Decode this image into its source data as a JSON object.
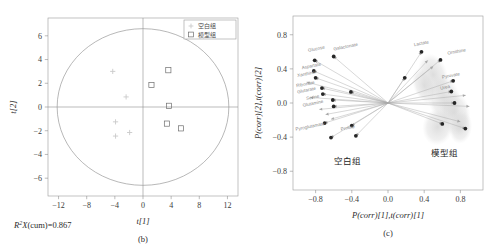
{
  "figure": {
    "panels": [
      "b",
      "c"
    ]
  },
  "chart_data": [
    {
      "type": "scatter",
      "panel_id": "(b)",
      "title": "",
      "xlabel": "t[1]",
      "ylabel": "t[2]",
      "xlim": [
        -13.5,
        13.5
      ],
      "ylim": [
        -7.5,
        7.5
      ],
      "xticks": [
        -12,
        -8,
        -4,
        0,
        4,
        8,
        12
      ],
      "xticklabels": [
        "−12",
        "−8",
        "−4",
        "0",
        "4",
        "8",
        "12"
      ],
      "yticks": [
        -6,
        -4,
        -2,
        0,
        2,
        4,
        6
      ],
      "yticklabels": [
        "−6",
        "−4",
        "−2",
        "0",
        "2",
        "4",
        "6"
      ],
      "grid": false,
      "annotation": "R²X(cum)=0.867",
      "hotelling_ellipse": {
        "rx": 12.2,
        "ry": 6.6
      },
      "legend": {
        "position": "top-right",
        "entries": [
          {
            "label": "空白组",
            "marker": "plus",
            "color": "#c9c9c9"
          },
          {
            "label": "模型组",
            "marker": "square",
            "color": "#6e6e6e"
          }
        ]
      },
      "series": [
        {
          "name": "空白组",
          "marker": "plus",
          "points": [
            {
              "x": -4.3,
              "y": 3.0
            },
            {
              "x": -2.4,
              "y": 0.85
            },
            {
              "x": -3.9,
              "y": -1.25
            },
            {
              "x": -3.9,
              "y": -2.45
            },
            {
              "x": -1.9,
              "y": -2.15
            }
          ]
        },
        {
          "name": "模型组",
          "marker": "square",
          "points": [
            {
              "x": 3.6,
              "y": 3.1
            },
            {
              "x": 1.2,
              "y": 1.85
            },
            {
              "x": 3.7,
              "y": 0.1
            },
            {
              "x": 3.4,
              "y": -1.4
            },
            {
              "x": 5.4,
              "y": -1.8
            }
          ]
        }
      ]
    },
    {
      "type": "scatter",
      "panel_id": "(c)",
      "title": "",
      "xlabel": "P(corr)[1],t(corr)[1]",
      "ylabel": "P(corr)[2],t(corr)[2]",
      "xlim": [
        -1.05,
        1.05
      ],
      "ylim": [
        -1.02,
        1.02
      ],
      "xticks": [
        -0.8,
        -0.4,
        0.0,
        0.4,
        0.8
      ],
      "xticklabels": [
        "−0.8",
        "−0.4",
        "0.0",
        "0.4",
        "0.8"
      ],
      "yticks": [
        -0.8,
        -0.4,
        0.0,
        0.4,
        0.8
      ],
      "yticklabels": [
        "−0.8",
        "−0.4",
        "0.0",
        "0.4",
        "0.8"
      ],
      "grid": false,
      "group_annotations": [
        {
          "text": "空白组",
          "x": -0.45,
          "y": -0.72
        },
        {
          "text": "模型组",
          "x": 0.62,
          "y": -0.62
        }
      ],
      "loadings": [
        {
          "label": "Glucose",
          "x": -0.81,
          "y": 0.5,
          "lx": -0.88,
          "ly": 0.6,
          "anchor": "start"
        },
        {
          "label": "Galactonate",
          "x": -0.6,
          "y": 0.545,
          "lx": -0.6,
          "ly": 0.615,
          "anchor": "start"
        },
        {
          "label": "Aspartate",
          "x": -0.82,
          "y": 0.375,
          "lx": -0.95,
          "ly": 0.395,
          "anchor": "start"
        },
        {
          "label": "Xanthine",
          "x": -0.8,
          "y": 0.295,
          "lx": -1.0,
          "ly": 0.305,
          "anchor": "start"
        },
        {
          "label": "Ribonate",
          "x": -0.73,
          "y": 0.175,
          "lx": -1.01,
          "ly": 0.185,
          "anchor": "start"
        },
        {
          "label": "Glutarate",
          "x": -0.72,
          "y": 0.105,
          "lx": -1.0,
          "ly": 0.112,
          "anchor": "start"
        },
        {
          "label": "Serine",
          "x": -0.61,
          "y": 0.035,
          "lx": -0.9,
          "ly": 0.035,
          "anchor": "start"
        },
        {
          "label": "Glutamine",
          "x": -0.6,
          "y": -0.04,
          "lx": -0.94,
          "ly": -0.045,
          "anchor": "start"
        },
        {
          "label": "Pyroglutamate",
          "x": -0.7,
          "y": -0.235,
          "lx": -1.02,
          "ly": -0.325,
          "anchor": "start"
        },
        {
          "label": "Proline",
          "x": -0.4,
          "y": -0.265,
          "lx": -0.52,
          "ly": -0.325,
          "anchor": "start"
        },
        {
          "label": "Lactate",
          "x": 0.37,
          "y": 0.6,
          "lx": 0.29,
          "ly": 0.665,
          "anchor": "start"
        },
        {
          "label": "Ornithine",
          "x": 0.58,
          "y": 0.505,
          "lx": 0.66,
          "ly": 0.565,
          "anchor": "start"
        },
        {
          "label": "Pyruvate",
          "x": 0.72,
          "y": 0.26,
          "lx": 0.6,
          "ly": 0.285,
          "anchor": "start"
        },
        {
          "label": "Urea",
          "x": 0.7,
          "y": 0.135,
          "lx": 0.58,
          "ly": 0.155,
          "anchor": "start"
        }
      ],
      "extra_points": [
        {
          "x": -0.41,
          "y": 0.13
        },
        {
          "x": -0.63,
          "y": -0.405
        },
        {
          "x": -0.355,
          "y": -0.385
        },
        {
          "x": 0.185,
          "y": 0.295
        },
        {
          "x": 0.735,
          "y": 0.0
        },
        {
          "x": 0.6,
          "y": -0.245
        },
        {
          "x": 0.855,
          "y": -0.3
        }
      ],
      "extra_arrow_targets": [
        {
          "x": -0.9,
          "y": 0.245
        },
        {
          "x": -0.86,
          "y": 0.065
        },
        {
          "x": -0.76,
          "y": -0.075
        },
        {
          "x": -0.69,
          "y": -0.135
        },
        {
          "x": -0.63,
          "y": -0.19
        },
        {
          "x": 0.86,
          "y": 0.09
        },
        {
          "x": 0.9,
          "y": -0.04
        },
        {
          "x": 0.8,
          "y": -0.22
        },
        {
          "x": 0.5,
          "y": 0.43
        },
        {
          "x": 0.44,
          "y": 0.5
        }
      ]
    }
  ]
}
